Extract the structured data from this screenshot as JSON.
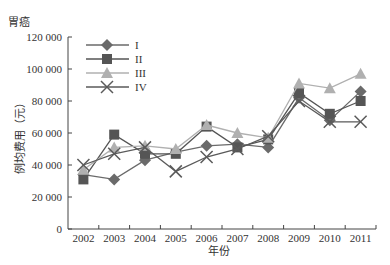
{
  "chart_data": {
    "type": "line",
    "title": "胃癌",
    "xlabel": "年份",
    "ylabel": "例均费用（元）",
    "categories": [
      "2002",
      "2003",
      "2004",
      "2005",
      "2006",
      "2007",
      "2008",
      "2009",
      "2010",
      "2011"
    ],
    "ylim": [
      0,
      120000
    ],
    "yticks": [
      0,
      20000,
      40000,
      60000,
      80000,
      100000,
      120000
    ],
    "ytick_labels": [
      "0",
      "20 000",
      "40 000",
      "60 000",
      "80 000",
      "100 000",
      "120 000"
    ],
    "grid": false,
    "legend_position": "upper-left inside",
    "series": [
      {
        "name": "I",
        "marker": "diamond",
        "color": "#6a6a6a",
        "values": [
          34000,
          31000,
          43000,
          48000,
          52000,
          53000,
          51000,
          82000,
          68000,
          86000
        ]
      },
      {
        "name": "II",
        "marker": "square",
        "color": "#555555",
        "values": [
          31000,
          59000,
          47000,
          47000,
          64000,
          51000,
          56000,
          85000,
          72000,
          80000
        ]
      },
      {
        "name": "III",
        "marker": "triangle",
        "color": "#b0b0b0",
        "values": [
          37000,
          51000,
          52000,
          50000,
          65000,
          60000,
          57000,
          91000,
          88000,
          97000
        ]
      },
      {
        "name": "IV",
        "marker": "x",
        "color": "#5a5a5a",
        "values": [
          40000,
          47000,
          51000,
          36000,
          45000,
          50000,
          58000,
          80000,
          67000,
          67000
        ]
      }
    ]
  }
}
